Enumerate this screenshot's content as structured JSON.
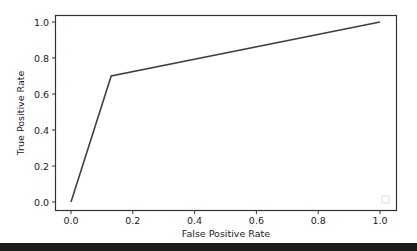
{
  "chart_data": {
    "type": "line",
    "title": "",
    "xlabel": "False Positive Rate",
    "ylabel": "True Positive Rate",
    "xlim": [
      -0.05,
      1.05
    ],
    "ylim": [
      -0.05,
      1.05
    ],
    "xticks": [
      "0.0",
      "0.2",
      "0.4",
      "0.6",
      "0.8",
      "1.0"
    ],
    "yticks": [
      "0.0",
      "0.2",
      "0.4",
      "0.6",
      "0.8",
      "1.0"
    ],
    "grid": false,
    "legend": {
      "position": "lower right",
      "entries": []
    },
    "series": [
      {
        "name": "ROC curve",
        "color": "#404040",
        "x": [
          0.0,
          0.13,
          1.0
        ],
        "y": [
          0.0,
          0.7,
          1.0
        ]
      }
    ]
  },
  "colors": {
    "line": "#404040",
    "axes": "#333333",
    "text": "#1a1a1a",
    "background": "#ffffff"
  }
}
